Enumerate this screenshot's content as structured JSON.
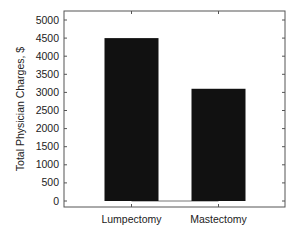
{
  "chart_data": {
    "type": "bar",
    "title": "",
    "xlabel": "",
    "ylabel": "Total Physician Charges, $",
    "categories": [
      "Lumpectomy",
      "Mastectomy"
    ],
    "values": [
      4500,
      3100
    ],
    "ylim": [
      -200,
      5300
    ],
    "yticks": [
      0,
      500,
      1000,
      1500,
      2000,
      2500,
      3000,
      3500,
      4000,
      4500,
      5000
    ],
    "grid": false,
    "legend": null,
    "bar_color": "#111111",
    "frame": "box"
  }
}
